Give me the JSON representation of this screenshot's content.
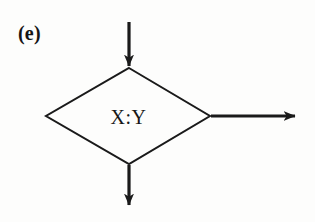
{
  "figure": {
    "panel_label": "(e)",
    "node_label": "X:Y",
    "stroke_color": "#1a1a1a",
    "background_color": "#fdfdfc",
    "diagram_type": "flowchart-decision-node",
    "shape": {
      "name": "diamond",
      "top_vertex": [
        129,
        68
      ],
      "right_vertex": [
        210,
        116
      ],
      "bottom_vertex": [
        129,
        164
      ],
      "left_vertex": [
        46,
        116
      ],
      "stroke_width": 2
    },
    "arrows": [
      {
        "name": "input-arrow-top",
        "direction": "down",
        "from": [
          129,
          22
        ],
        "to": [
          129,
          68
        ]
      },
      {
        "name": "output-arrow-right",
        "direction": "right",
        "from": [
          210,
          116
        ],
        "to": [
          297,
          116
        ]
      },
      {
        "name": "output-arrow-bottom",
        "direction": "down",
        "from": [
          129,
          164
        ],
        "to": [
          129,
          207
        ]
      }
    ]
  }
}
